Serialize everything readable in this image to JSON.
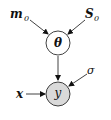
{
  "diagram": {
    "nodes": {
      "theta": {
        "label": "θ",
        "fill": "#ffffff"
      },
      "y": {
        "label": "y",
        "fill": "#d9d9d9"
      }
    },
    "params": {
      "m0": {
        "base": "m",
        "sub": "0"
      },
      "S0": {
        "base": "S",
        "sub": "0"
      },
      "x": {
        "label": "x"
      },
      "sigma": {
        "label": "σ"
      }
    },
    "edges": [
      {
        "from": "m0",
        "to": "theta"
      },
      {
        "from": "S0",
        "to": "theta"
      },
      {
        "from": "theta",
        "to": "y"
      },
      {
        "from": "x",
        "to": "y"
      },
      {
        "from": "sigma",
        "to": "y"
      }
    ]
  }
}
